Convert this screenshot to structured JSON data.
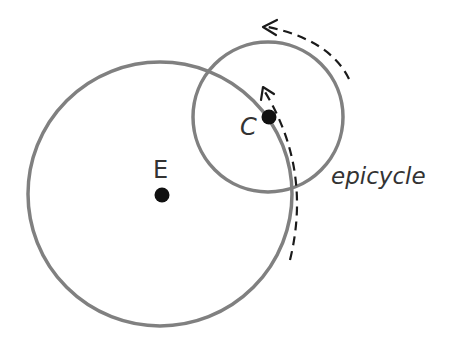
{
  "diagram": {
    "colors": {
      "circle_stroke": "#808080",
      "point_fill": "#111111",
      "dash_stroke": "#1a1a1a",
      "text": "#333333",
      "background": "#ffffff"
    },
    "nodes": [
      {
        "id": "E",
        "label": "E",
        "description": "Earth at center of deferent"
      },
      {
        "id": "C",
        "label": "C",
        "description": "Center of epicycle on deferent"
      }
    ],
    "circles": [
      {
        "id": "deferent",
        "label": ""
      },
      {
        "id": "epicycle",
        "label": "epicycle"
      }
    ],
    "arrows": [
      {
        "id": "epicycle-motion",
        "style": "dashed",
        "direction": "counterclockwise"
      },
      {
        "id": "deferent-motion",
        "style": "dashed",
        "direction": "counterclockwise"
      }
    ],
    "labels": {
      "earth": "E",
      "center": "C",
      "epicycle": "epicycle"
    }
  }
}
